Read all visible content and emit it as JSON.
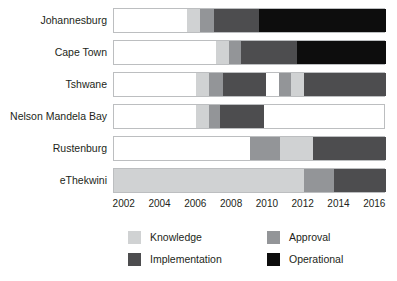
{
  "chart_data": {
    "type": "bar",
    "orientation": "horizontal-stacked-timeline",
    "title": "",
    "subtitle": "",
    "xlabel": "",
    "ylabel": "",
    "xlim": [
      2001.4,
      2016.6
    ],
    "grid": false,
    "legend_position": "bottom",
    "xticks": [
      2002,
      2004,
      2006,
      2008,
      2010,
      2012,
      2014,
      2016
    ],
    "xtick_labels": [
      "2002",
      "2004",
      "2006",
      "2008",
      "2010",
      "2012",
      "2014",
      "2016"
    ],
    "categories": [
      "Johannesburg",
      "Cape Town",
      "Tshwane",
      "Nelson Mandela Bay",
      "Rustenburg",
      "eThekwini"
    ],
    "legend": [
      {
        "name": "Knowledge",
        "color": "#d0d2d3"
      },
      {
        "name": "Approval",
        "color": "#939598"
      },
      {
        "name": "Implementation",
        "color": "#4d4d4f"
      },
      {
        "name": "Operational",
        "color": "#0d0d0d"
      }
    ],
    "series": [
      {
        "name": "Knowledge",
        "color": "#d0d2d3"
      },
      {
        "name": "Approval",
        "color": "#939598"
      },
      {
        "name": "Implementation",
        "color": "#4d4d4f"
      },
      {
        "name": "Operational",
        "color": "#0d0d0d"
      }
    ],
    "bars": [
      {
        "category": "Johannesburg",
        "segments": [
          {
            "phase": "Knowledge",
            "start": 2005.5,
            "end": 2006.2,
            "color": "#d0d2d3"
          },
          {
            "phase": "Approval",
            "start": 2006.2,
            "end": 2007.0,
            "color": "#939598"
          },
          {
            "phase": "Implementation",
            "start": 2007.0,
            "end": 2009.5,
            "color": "#4d4d4f"
          },
          {
            "phase": "Operational",
            "start": 2009.5,
            "end": 2016.6,
            "color": "#0d0d0d"
          }
        ]
      },
      {
        "category": "Cape Town",
        "segments": [
          {
            "phase": "Knowledge",
            "start": 2007.1,
            "end": 2007.8,
            "color": "#d0d2d3"
          },
          {
            "phase": "Approval",
            "start": 2007.8,
            "end": 2008.5,
            "color": "#939598"
          },
          {
            "phase": "Implementation",
            "start": 2008.5,
            "end": 2011.6,
            "color": "#4d4d4f"
          },
          {
            "phase": "Operational",
            "start": 2011.6,
            "end": 2016.6,
            "color": "#0d0d0d"
          }
        ]
      },
      {
        "category": "Tshwane",
        "segments": [
          {
            "phase": "Knowledge",
            "start": 2006.0,
            "end": 2006.7,
            "color": "#d0d2d3"
          },
          {
            "phase": "Approval",
            "start": 2006.7,
            "end": 2007.5,
            "color": "#939598"
          },
          {
            "phase": "Implementation",
            "start": 2007.5,
            "end": 2009.9,
            "color": "#4d4d4f"
          },
          {
            "phase": "Approval",
            "start": 2010.6,
            "end": 2011.3,
            "color": "#939598"
          },
          {
            "phase": "Knowledge",
            "start": 2011.3,
            "end": 2012.0,
            "color": "#d0d2d3"
          },
          {
            "phase": "Implementation",
            "start": 2012.0,
            "end": 2016.6,
            "color": "#4d4d4f"
          }
        ]
      },
      {
        "category": "Nelson Mandela Bay",
        "segments": [
          {
            "phase": "Knowledge",
            "start": 2006.0,
            "end": 2006.7,
            "color": "#d0d2d3"
          },
          {
            "phase": "Approval",
            "start": 2006.7,
            "end": 2007.3,
            "color": "#939598"
          },
          {
            "phase": "Implementation",
            "start": 2007.3,
            "end": 2009.8,
            "color": "#4d4d4f"
          }
        ]
      },
      {
        "category": "Rustenburg",
        "segments": [
          {
            "phase": "Approval",
            "start": 2009.0,
            "end": 2010.7,
            "color": "#939598"
          },
          {
            "phase": "Knowledge",
            "start": 2010.7,
            "end": 2012.5,
            "color": "#d0d2d3"
          },
          {
            "phase": "Implementation",
            "start": 2012.5,
            "end": 2016.6,
            "color": "#4d4d4f"
          }
        ]
      },
      {
        "category": "eThekwini",
        "segments": [
          {
            "phase": "Knowledge",
            "start": 2001.4,
            "end": 2012.0,
            "color": "#d0d2d3"
          },
          {
            "phase": "Approval",
            "start": 2012.0,
            "end": 2013.7,
            "color": "#939598"
          },
          {
            "phase": "Implementation",
            "start": 2013.7,
            "end": 2016.6,
            "color": "#4d4d4f"
          }
        ]
      }
    ]
  }
}
